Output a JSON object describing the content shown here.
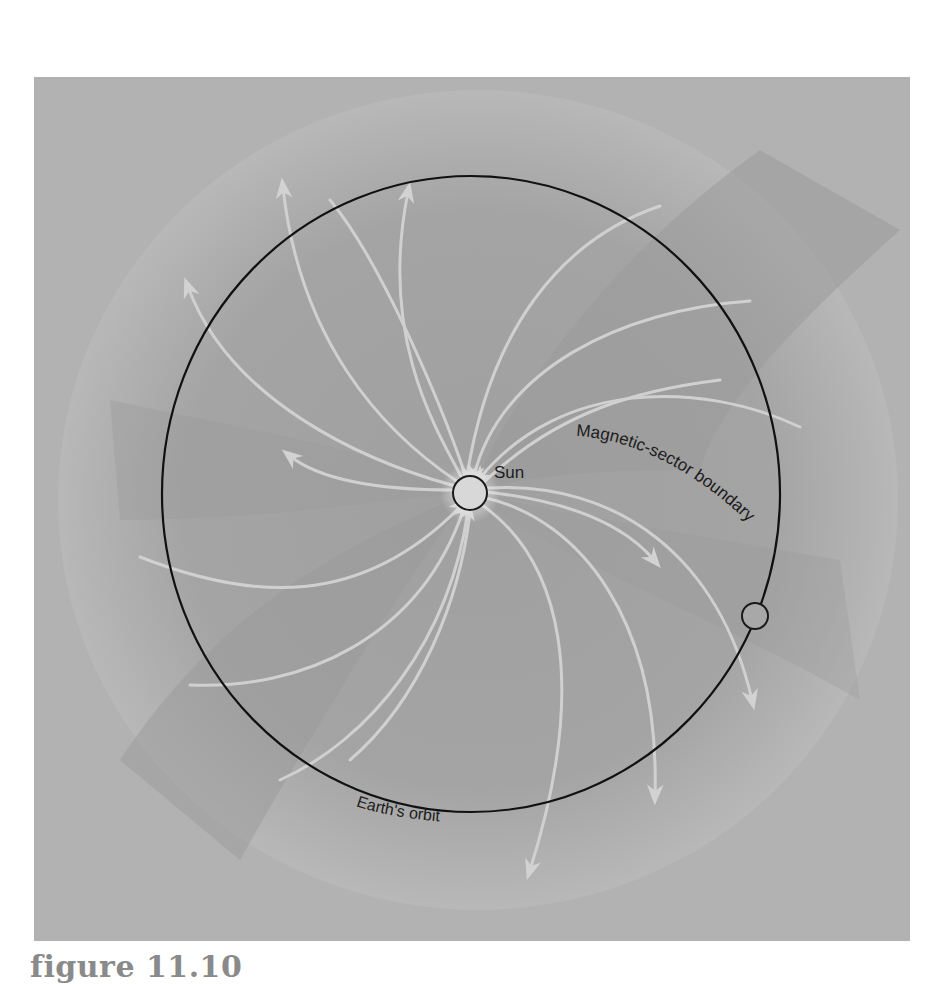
{
  "figure": {
    "caption": "figure 11.10",
    "labels": {
      "sun": "Sun",
      "earth_orbit": "Earth's orbit",
      "sector_boundary": "Magnetic-sector boundary"
    },
    "colors": {
      "background_light": "#b4b4b4",
      "background_dark": "#989898",
      "field_lines": "#d2d2d2",
      "orbit": "#111111",
      "sun_fill": "#d8d8d8"
    },
    "objects": [
      {
        "name": "Sun",
        "cx": 470,
        "cy": 493,
        "r": 17
      },
      {
        "name": "Earth",
        "cx": 755,
        "cy": 616,
        "r": 13
      },
      {
        "name": "Earth's orbit",
        "cx": 471,
        "cy": 494,
        "rx": 309,
        "ry": 318
      }
    ],
    "field_line_groups": [
      {
        "direction": "outward",
        "region": "upper-left sector",
        "count": 5
      },
      {
        "direction": "inward",
        "region": "upper-right sector",
        "count": 4
      },
      {
        "direction": "outward",
        "region": "lower-right sector",
        "count": 4
      },
      {
        "direction": "inward",
        "region": "lower-left sector",
        "count": 4
      }
    ]
  }
}
